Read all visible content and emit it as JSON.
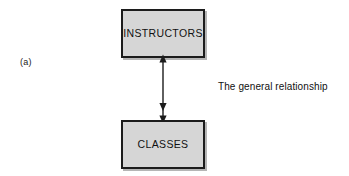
{
  "figure": {
    "part_label": "(a)",
    "caption": "The general relationship",
    "background_color": "#ffffff",
    "box_fill_color": "#d6d6d6",
    "box_border_color": "#1c1c1c",
    "connector_color": "#1c1c1c",
    "text_color": "#111111"
  },
  "entities": [
    {
      "id": "instructors",
      "label": "INSTRUCTORS",
      "x": 121,
      "y": 9,
      "width": 84,
      "height": 49
    },
    {
      "id": "classes",
      "label": "CLASSES",
      "x": 121,
      "y": 120,
      "width": 84,
      "height": 49
    }
  ],
  "connector": {
    "id": "instructors-classes-relationship",
    "type": "double-headed-arrow",
    "from": "INSTRUCTORS",
    "to": "CLASSES",
    "orientation": "vertical",
    "arrowheads": [
      "up",
      "down"
    ]
  }
}
